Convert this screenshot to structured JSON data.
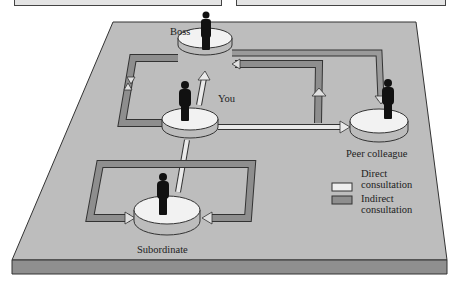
{
  "diagram": {
    "nodes": [
      {
        "id": "boss",
        "label": "Boss"
      },
      {
        "id": "you",
        "label": "You"
      },
      {
        "id": "peer",
        "label": "Peer colleague"
      },
      {
        "id": "subordinate",
        "label": "Subordinate"
      }
    ],
    "legend": [
      {
        "label_line1": "Direct",
        "label_line2": "consultation",
        "color": "#efefef"
      },
      {
        "label_line1": "Indirect",
        "label_line2": "consultation",
        "color": "#8e8e8e"
      }
    ],
    "colors": {
      "platform_top": "#bdbdbd",
      "platform_side": "#8f8f8f",
      "direct_arrow": "#e8e8e8",
      "indirect_arrow": "#8e8e8e",
      "disc_top": "#f2f2f2",
      "disc_side": "#bcbcbc"
    },
    "edges": [
      {
        "from": "you",
        "to": "boss",
        "type": "direct"
      },
      {
        "from": "you",
        "to": "peer",
        "type": "direct"
      },
      {
        "from": "you",
        "to": "subordinate",
        "type": "direct"
      },
      {
        "from": "boss",
        "to": "peer",
        "type": "direct"
      },
      {
        "from": "peer",
        "to": "boss",
        "type": "indirect"
      },
      {
        "from": "you",
        "to": "boss",
        "type": "indirect"
      },
      {
        "from": "subordinate",
        "to": "subordinate",
        "type": "indirect"
      }
    ]
  }
}
